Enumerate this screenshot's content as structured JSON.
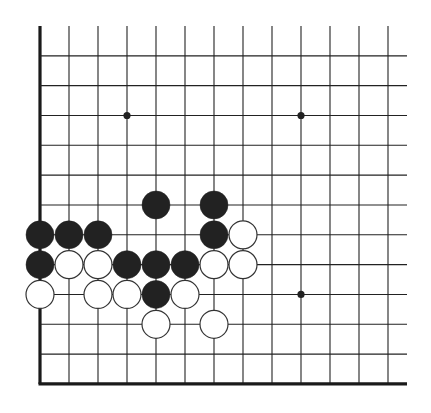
{
  "diagram": {
    "type": "go-board-fragment",
    "grid": {
      "origin_x": 40,
      "origin_y": 26,
      "col_spacing": 29,
      "row_spacing": 29.83,
      "columns": 13,
      "rows": 13,
      "line_right_end_x": 407,
      "edges": [
        "left",
        "bottom"
      ]
    },
    "colors": {
      "line": "#222222",
      "edge": "#1a1a1a",
      "black_stone": "#222222",
      "white_stone_fill": "#ffffff",
      "white_stone_stroke": "#333333",
      "background": "#ffffff"
    },
    "star_points": [
      {
        "col": 3,
        "row": 3
      },
      {
        "col": 9,
        "row": 3
      },
      {
        "col": 9,
        "row": 9
      }
    ],
    "stones": [
      {
        "color": "black",
        "col": 4,
        "row": 6
      },
      {
        "color": "black",
        "col": 6,
        "row": 6
      },
      {
        "color": "black",
        "col": 0,
        "row": 7
      },
      {
        "color": "black",
        "col": 1,
        "row": 7
      },
      {
        "color": "black",
        "col": 2,
        "row": 7
      },
      {
        "color": "black",
        "col": 6,
        "row": 7
      },
      {
        "color": "white",
        "col": 7,
        "row": 7
      },
      {
        "color": "black",
        "col": 0,
        "row": 8
      },
      {
        "color": "white",
        "col": 1,
        "row": 8
      },
      {
        "color": "white",
        "col": 2,
        "row": 8
      },
      {
        "color": "black",
        "col": 3,
        "row": 8
      },
      {
        "color": "black",
        "col": 4,
        "row": 8
      },
      {
        "color": "black",
        "col": 5,
        "row": 8
      },
      {
        "color": "white",
        "col": 6,
        "row": 8
      },
      {
        "color": "white",
        "col": 7,
        "row": 8
      },
      {
        "color": "white",
        "col": 0,
        "row": 9
      },
      {
        "color": "white",
        "col": 2,
        "row": 9
      },
      {
        "color": "white",
        "col": 3,
        "row": 9
      },
      {
        "color": "black",
        "col": 4,
        "row": 9
      },
      {
        "color": "white",
        "col": 5,
        "row": 9
      },
      {
        "color": "white",
        "col": 4,
        "row": 10
      },
      {
        "color": "white",
        "col": 6,
        "row": 10
      }
    ]
  }
}
